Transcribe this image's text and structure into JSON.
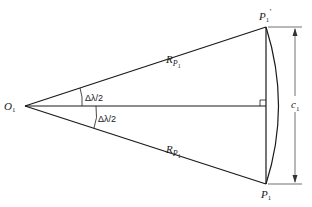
{
  "diagram": {
    "points": {
      "origin": {
        "label": "O",
        "sub": "1"
      },
      "top": {
        "label": "P",
        "sub": "1",
        "prime": "′"
      },
      "bottom": {
        "label": "P",
        "sub": "1"
      }
    },
    "radius_labels": {
      "upper": {
        "label": "R",
        "sub1": "P",
        "sub2": "1"
      },
      "lower": {
        "label": "R",
        "sub1": "P",
        "sub2": "1"
      }
    },
    "angle_labels": {
      "upper": "Δλ/2",
      "lower": "Δλ/2"
    },
    "chord_label": {
      "label": "c",
      "sub": "1"
    },
    "colors": {
      "stroke": "#1a1a1a",
      "dimension": "#333333"
    }
  }
}
